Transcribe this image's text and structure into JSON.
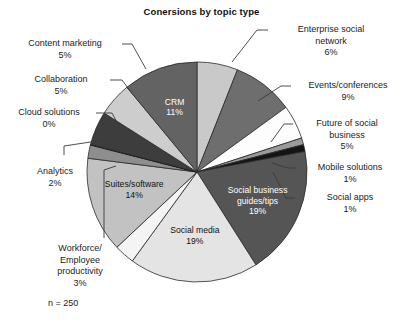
{
  "chart_data": {
    "type": "pie",
    "title": "Conersions by topic type",
    "xlabel": "",
    "ylabel": "",
    "legend_position": "none",
    "grid": false,
    "start_angle_deg": 0,
    "direction": "clockwise",
    "note": "n = 250",
    "categories": [
      "Enterprise social network",
      "Events/conferences",
      "Future of social business",
      "Mobile solutions",
      "Social apps",
      "Social business guides/tips",
      "Social media",
      "Workforce/Employee productivity",
      "Suites/software",
      "Analytics",
      "Cloud solutions",
      "Collaboration",
      "Content marketing",
      "CRM"
    ],
    "values": [
      6,
      9,
      5,
      1,
      1,
      19,
      19,
      3,
      14,
      2,
      0,
      5,
      5,
      11
    ],
    "value_unit": "%",
    "slices": [
      {
        "label": "Enterprise social network",
        "value": 6,
        "display": "6%",
        "color": "#c9c9c9",
        "label_placement": "callout"
      },
      {
        "label": "Events/conferences",
        "value": 9,
        "display": "9%",
        "color": "#6e6e6e",
        "label_placement": "callout"
      },
      {
        "label": "Future of social business",
        "value": 5,
        "display": "5%",
        "color": "#fdfdfd",
        "label_placement": "callout"
      },
      {
        "label": "Mobile solutions",
        "value": 1,
        "display": "1%",
        "color": "#9a9a9a",
        "label_placement": "callout"
      },
      {
        "label": "Social apps",
        "value": 1,
        "display": "1%",
        "color": "#141414",
        "label_placement": "callout"
      },
      {
        "label": "Social business guides/tips",
        "value": 19,
        "display": "19%",
        "color": "#555555",
        "label_placement": "inside"
      },
      {
        "label": "Social media",
        "value": 19,
        "display": "19%",
        "color": "#e4e4e4",
        "label_placement": "inside"
      },
      {
        "label": "Workforce/Employee productivity",
        "value": 3,
        "display": "3%",
        "color": "#f4f4f4",
        "label_placement": "callout"
      },
      {
        "label": "Suites/software",
        "value": 14,
        "display": "14%",
        "color": "#c2c2c2",
        "label_placement": "inside"
      },
      {
        "label": "Analytics",
        "value": 2,
        "display": "2%",
        "color": "#8e8e8e",
        "label_placement": "callout"
      },
      {
        "label": "Cloud solutions",
        "value": 0,
        "display": "0%",
        "color": "#101010",
        "label_placement": "callout"
      },
      {
        "label": "Collaboration",
        "value": 5,
        "display": "5%",
        "color": "#3d3d3d",
        "label_placement": "callout"
      },
      {
        "label": "Content marketing",
        "value": 5,
        "display": "5%",
        "color": "#cdcdcd",
        "label_placement": "callout"
      },
      {
        "label": "CRM",
        "value": 11,
        "display": "11%",
        "color": "#636363",
        "label_placement": "inside"
      }
    ]
  },
  "title": "Conersions by topic type",
  "sample_size": "n = 250",
  "callouts": {
    "content_marketing": "Content marketing\n5%",
    "collaboration": "Collaboration\n5%",
    "cloud_solutions": "Cloud solutions\n0%",
    "analytics": "Analytics\n2%",
    "workforce": "Workforce/\nEmployee\nproductivity\n3%",
    "enterprise_social_network": "Enterprise social\nnetwork\n6%",
    "events_conferences": "Events/conferences\n9%",
    "future_of_social_business": "Future of social\nbusiness\n5%",
    "mobile_solutions": "Mobile solutions\n1%",
    "social_apps": "Social apps\n1%"
  },
  "inside_labels": {
    "crm": "CRM\n11%",
    "social_business_guides": "Social business\nguides/tips\n19%",
    "social_media": "Social media\n19%",
    "suites_software": "Suites/software\n14%"
  },
  "colors": {
    "background": "#ffffff",
    "text": "#1b1b1b",
    "slice_outline": "#2a2a2a",
    "leader_line": "#3a3a3a"
  }
}
